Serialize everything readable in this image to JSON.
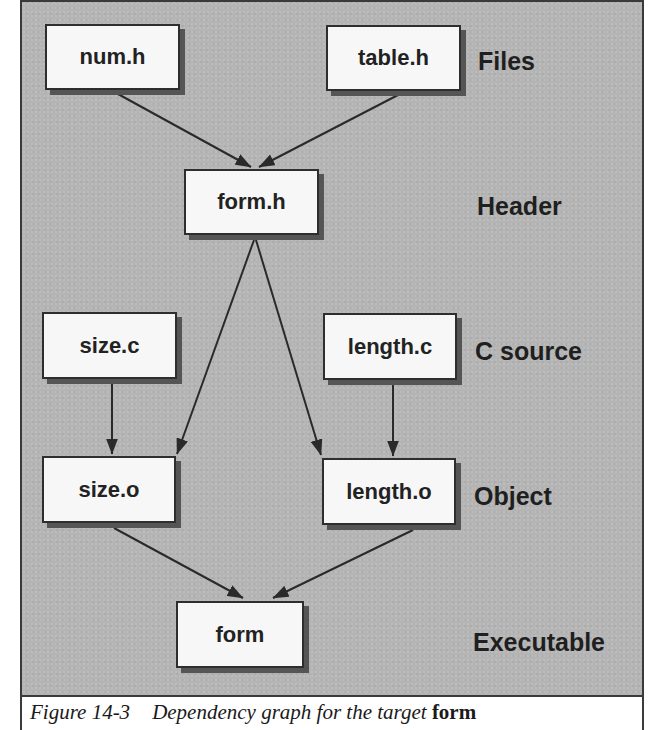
{
  "diagram": {
    "type": "dependency-graph",
    "nodes": {
      "num_h": "num.h",
      "table_h": "table.h",
      "form_h": "form.h",
      "size_c": "size.c",
      "length_c": "length.c",
      "size_o": "size.o",
      "length_o": "length.o",
      "form": "form"
    },
    "levels": {
      "files": "Files",
      "header": "Header",
      "c_source": "C source",
      "object": "Object",
      "executable": "Executable"
    },
    "edges": [
      {
        "from": "num.h",
        "to": "form.h"
      },
      {
        "from": "table.h",
        "to": "form.h"
      },
      {
        "from": "form.h",
        "to": "size.o"
      },
      {
        "from": "form.h",
        "to": "length.o"
      },
      {
        "from": "size.c",
        "to": "size.o"
      },
      {
        "from": "length.c",
        "to": "length.o"
      },
      {
        "from": "size.o",
        "to": "form"
      },
      {
        "from": "length.o",
        "to": "form"
      }
    ],
    "colors": {
      "background": "#b4b4b4",
      "node_fill": "#f7f7f7",
      "node_border": "#2e2e2e",
      "node_shadow": "#555555",
      "edge": "#2a2a2a"
    }
  },
  "caption": {
    "number": "Figure 14-3",
    "text": "Dependency graph for the target ",
    "target": "form"
  }
}
